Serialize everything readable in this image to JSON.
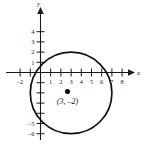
{
  "chart_data": {
    "type": "scatter",
    "title": "",
    "subtitle": "",
    "xlabel": "x",
    "ylabel": "y",
    "xlim": [
      -2.6,
      8.8
    ],
    "ylim": [
      -6.8,
      5.0
    ],
    "grid": false,
    "legend": null,
    "x_ticks": [
      -2,
      -1,
      0,
      1,
      2,
      3,
      4,
      5,
      6,
      7,
      8
    ],
    "x_tick_labels": [
      "–2",
      "",
      "",
      "1",
      "2",
      "3",
      "4",
      "5",
      "6",
      "7",
      "8"
    ],
    "y_ticks": [
      -6,
      -5,
      -4,
      -3,
      -2,
      -1,
      0,
      1,
      2,
      3,
      4
    ],
    "y_tick_labels": [
      "–6",
      "–5",
      "",
      "",
      "",
      "",
      "",
      "1",
      "2",
      "3",
      "4"
    ],
    "shapes": [
      {
        "kind": "circle",
        "center_x": 3,
        "center_y": -2,
        "radius": 4,
        "stroke": "#111111",
        "fill": "none"
      }
    ],
    "points": [
      {
        "x": 3,
        "y": -2,
        "label": "(3, –2)",
        "marker": "filled-circle",
        "color": "#000000"
      }
    ]
  },
  "labels": {
    "x_axis_name": "x",
    "y_axis_name": "y",
    "center_point": "(3, –2)"
  }
}
